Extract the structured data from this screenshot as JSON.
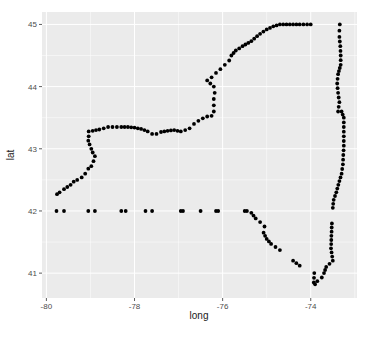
{
  "chart_data": {
    "type": "scatter",
    "title": "",
    "xlabel": "long",
    "ylabel": "lat",
    "xlim": [
      -80.1,
      -72.95
    ],
    "ylim": [
      40.6,
      45.2
    ],
    "x_ticks": [
      -80,
      -78,
      -76,
      -74
    ],
    "x_tick_labels": [
      "-80",
      "-78",
      "-76",
      "-74"
    ],
    "y_ticks": [
      41,
      42,
      43,
      44,
      45
    ],
    "y_tick_labels": [
      "41",
      "42",
      "43",
      "44",
      "45"
    ],
    "grid": true,
    "legend": null,
    "colors": {
      "panel": "#ebebeb",
      "grid": "#ffffff",
      "points": "#000000"
    },
    "series": [
      {
        "name": "New York state border",
        "points": [
          [
            -79.76,
            42.27
          ],
          [
            -79.7,
            42.3
          ],
          [
            -79.6,
            42.35
          ],
          [
            -79.45,
            42.42
          ],
          [
            -79.38,
            42.47
          ],
          [
            -79.3,
            42.5
          ],
          [
            -79.2,
            42.54
          ],
          [
            -79.12,
            42.6
          ],
          [
            -79.05,
            42.68
          ],
          [
            -78.98,
            42.72
          ],
          [
            -78.93,
            42.8
          ],
          [
            -78.9,
            42.88
          ],
          [
            -78.95,
            42.94
          ],
          [
            -78.98,
            43.0
          ],
          [
            -79.02,
            43.07
          ],
          [
            -79.05,
            43.13
          ],
          [
            -79.04,
            43.2
          ],
          [
            -79.04,
            43.28
          ],
          [
            -78.95,
            43.29
          ],
          [
            -78.8,
            43.31
          ],
          [
            -78.6,
            43.35
          ],
          [
            -78.5,
            43.35
          ],
          [
            -78.3,
            43.35
          ],
          [
            -78.15,
            43.35
          ],
          [
            -78.0,
            43.34
          ],
          [
            -77.85,
            43.32
          ],
          [
            -77.7,
            43.28
          ],
          [
            -77.6,
            43.24
          ],
          [
            -77.5,
            43.24
          ],
          [
            -77.4,
            43.27
          ],
          [
            -77.25,
            43.29
          ],
          [
            -77.1,
            43.3
          ],
          [
            -76.95,
            43.28
          ],
          [
            -76.85,
            43.3
          ],
          [
            -76.75,
            43.33
          ],
          [
            -76.65,
            43.4
          ],
          [
            -76.55,
            43.45
          ],
          [
            -76.45,
            43.49
          ],
          [
            -76.35,
            43.52
          ],
          [
            -76.25,
            43.53
          ],
          [
            -76.2,
            43.6
          ],
          [
            -76.2,
            43.7
          ],
          [
            -76.2,
            43.8
          ],
          [
            -76.18,
            43.9
          ],
          [
            -76.2,
            44.0
          ],
          [
            -76.28,
            44.05
          ],
          [
            -76.35,
            44.1
          ],
          [
            -76.25,
            44.15
          ],
          [
            -76.15,
            44.22
          ],
          [
            -76.05,
            44.28
          ],
          [
            -75.95,
            44.35
          ],
          [
            -75.85,
            44.42
          ],
          [
            -75.8,
            44.5
          ],
          [
            -75.7,
            44.58
          ],
          [
            -75.55,
            44.65
          ],
          [
            -75.35,
            44.73
          ],
          [
            -75.15,
            44.85
          ],
          [
            -75.0,
            44.92
          ],
          [
            -74.85,
            44.97
          ],
          [
            -74.7,
            45.0
          ],
          [
            -74.55,
            45.0
          ],
          [
            -74.4,
            45.0
          ],
          [
            -74.25,
            45.0
          ],
          [
            -74.0,
            45.0
          ],
          [
            -73.34,
            45.0
          ],
          [
            -73.35,
            44.9
          ],
          [
            -73.35,
            44.8
          ],
          [
            -73.33,
            44.65
          ],
          [
            -73.32,
            44.5
          ],
          [
            -73.32,
            44.35
          ],
          [
            -73.38,
            44.2
          ],
          [
            -73.4,
            44.05
          ],
          [
            -73.38,
            43.9
          ],
          [
            -73.35,
            43.75
          ],
          [
            -73.38,
            43.6
          ],
          [
            -73.3,
            43.6
          ],
          [
            -73.25,
            43.5
          ],
          [
            -73.25,
            43.35
          ],
          [
            -73.25,
            43.2
          ],
          [
            -73.25,
            43.05
          ],
          [
            -73.26,
            42.9
          ],
          [
            -73.27,
            42.75
          ],
          [
            -73.3,
            42.6
          ],
          [
            -73.35,
            42.48
          ],
          [
            -73.42,
            42.3
          ],
          [
            -73.48,
            42.18
          ],
          [
            -73.5,
            42.05
          ],
          [
            -73.52,
            41.8
          ],
          [
            -73.53,
            41.6
          ],
          [
            -73.54,
            41.4
          ],
          [
            -73.5,
            41.2
          ],
          [
            -73.65,
            41.1
          ],
          [
            -73.7,
            41.0
          ],
          [
            -73.75,
            40.93
          ],
          [
            -73.85,
            40.87
          ],
          [
            -73.9,
            40.82
          ],
          [
            -73.93,
            40.85
          ],
          [
            -73.92,
            41.0
          ],
          [
            -74.4,
            41.2
          ],
          [
            -74.25,
            41.12
          ],
          [
            -74.7,
            41.37
          ],
          [
            -74.8,
            41.42
          ],
          [
            -74.9,
            41.47
          ],
          [
            -75.0,
            41.55
          ],
          [
            -75.07,
            41.65
          ],
          [
            -75.05,
            41.75
          ],
          [
            -75.15,
            41.82
          ],
          [
            -75.25,
            41.88
          ],
          [
            -75.35,
            41.97
          ],
          [
            -75.45,
            42.0
          ],
          [
            -75.5,
            42.0
          ],
          [
            -76.1,
            42.0
          ],
          [
            -76.15,
            42.0
          ],
          [
            -76.5,
            42.0
          ],
          [
            -76.9,
            42.0
          ],
          [
            -76.95,
            42.0
          ],
          [
            -77.6,
            42.0
          ],
          [
            -77.75,
            42.0
          ],
          [
            -78.2,
            42.0
          ],
          [
            -78.3,
            42.0
          ],
          [
            -78.9,
            42.0
          ],
          [
            -79.05,
            42.0
          ],
          [
            -79.6,
            42.0
          ],
          [
            -79.77,
            42.0
          ]
        ]
      }
    ]
  }
}
